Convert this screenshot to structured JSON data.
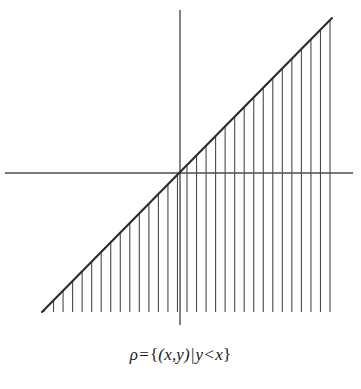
{
  "figure": {
    "title": "",
    "caption": "ρ = {(x,y) | y < x}",
    "caption_parts": {
      "relation_symbol": "ρ",
      "equals": "=",
      "open_brace": "{",
      "tuple": "(x,y)",
      "divider": "|",
      "condition_left": "y",
      "condition_op": "<",
      "condition_right": "x",
      "close_brace": "}"
    },
    "background_color": "#ffffff",
    "line_color": "#2b2b2b",
    "hatch_color": "#4a4a4a",
    "axis_color": "#4d4d4d"
  },
  "chart_data": {
    "type": "line",
    "title": "",
    "subtitle": "",
    "xlabel": "",
    "ylabel": "",
    "xlim": [
      -10,
      10
    ],
    "ylim": [
      -10,
      10
    ],
    "grid": false,
    "legend": "none",
    "series": [
      {
        "name": "y = x",
        "type": "line",
        "x": [
          -8.0,
          8.0
        ],
        "y": [
          -8.0,
          8.0
        ],
        "style": "solid",
        "note": "boundary line of the relation, drawn from lower-left to upper-right through the origin"
      }
    ],
    "shaded_region": {
      "name": "y < x",
      "description": "region below the line y = x, indicated by vertical hatch lines dropping from the boundary line down to the bottom of the plot",
      "hatch_orientation": "vertical",
      "hatch_count": 31,
      "hatch_spacing_px": 9.5
    },
    "axes": {
      "x_axis": {
        "label": "",
        "shown": true,
        "ticks": []
      },
      "y_axis": {
        "label": "",
        "shown": true,
        "ticks": []
      },
      "origin_marked": false
    },
    "annotations": [
      {
        "text": "ρ = {(x,y) | y < x}",
        "position": "below-plot",
        "align": "center"
      }
    ]
  },
  "geometry": {
    "origin_px": {
      "x": 180,
      "y": 173
    },
    "x_axis_px": {
      "x1": 5,
      "x2": 353,
      "y": 173
    },
    "y_axis_px": {
      "x": 180,
      "y1": 10,
      "y2": 325
    },
    "diagonal_px": {
      "x1": 42,
      "y1": 312,
      "x2": 332,
      "y2": 18
    },
    "hatch_baseline_y_px": 312,
    "hatch_start_x_px": 44,
    "hatch_end_x_px": 330
  }
}
